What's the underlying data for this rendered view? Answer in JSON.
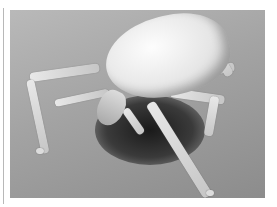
{
  "image": {
    "subject": "tick-sem-micrograph",
    "description": "Grayscale scanning electron micrograph of a tick on a flat surface",
    "colors": {
      "background": "#ffffff",
      "surface_light": "#b9b9b9",
      "surface_dark": "#8c8c8c",
      "body_highlight": "#fdfdfd",
      "shadow": "#1a1a1a"
    }
  }
}
